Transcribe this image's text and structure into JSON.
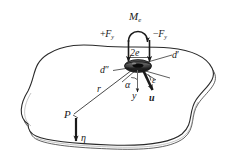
{
  "figure": {
    "type": "engineering-mechanics-diagram",
    "background_color": "#ffffff",
    "line_color": "#1a1a1a",
    "plate_fill": "#ffffff",
    "crack_fill": "#3a3a3a"
  },
  "labels": {
    "moment": {
      "base": "M",
      "sub": "e",
      "text": "M"
    },
    "force_left": {
      "sign": "+",
      "base": "F",
      "sub": "y"
    },
    "force_right": {
      "sign": "−",
      "base": "F",
      "sub": "y"
    },
    "crack_width": "2e",
    "d_prime": "d",
    "d_prime_mark": "′",
    "d_double_prime": "d",
    "d_double_prime_mark": "″",
    "radius": "r",
    "alpha": "α",
    "epsilon": "ε",
    "axis_y": "y",
    "vector_u": "u",
    "point_P": "P",
    "eta": "η"
  },
  "geometry": {
    "crack_center": {
      "x": 138,
      "y": 66
    },
    "crack_rx": 13,
    "crack_ry": 6,
    "point_P": {
      "x": 72,
      "y": 116
    },
    "plate_thickness_px": 4,
    "couple_spacing_px": 22
  },
  "annotations": [
    {
      "name": "moment-arc",
      "label": "M",
      "kind": "curved-moment-arrow"
    },
    {
      "name": "force-left",
      "label": "+F",
      "kind": "down-arrow"
    },
    {
      "name": "force-right",
      "label": "−F",
      "kind": "down-arrow"
    },
    {
      "name": "crack-span",
      "label": "2e",
      "kind": "dimension"
    },
    {
      "name": "radius-line",
      "label": "r",
      "kind": "leader-line"
    },
    {
      "name": "displacement-u",
      "label": "u",
      "kind": "vector-arrow"
    },
    {
      "name": "load-eta",
      "label": "η",
      "kind": "vector-arrow"
    }
  ]
}
